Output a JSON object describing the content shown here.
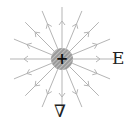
{
  "diagram": {
    "title": "",
    "type": "electric field of positive point charge",
    "charge": {
      "sign": "+",
      "center": [
        62,
        59
      ],
      "radius": 11,
      "fill": "#9a9a9a",
      "hatch": "#d8d8d8",
      "sign_color": "#111111"
    },
    "field_lines": {
      "count": 16,
      "inner_radius": 11,
      "outer_radius": 52,
      "arrow_radius": 38,
      "color": "#b5b5b5",
      "direction": "outward"
    },
    "labels": {
      "field": "E",
      "operator": "∇"
    }
  }
}
